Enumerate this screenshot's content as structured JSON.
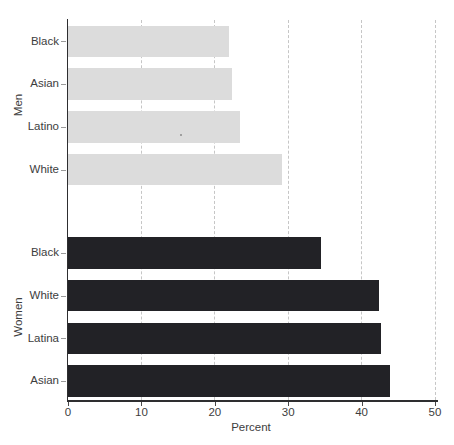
{
  "chart_data": {
    "type": "bar",
    "orientation": "horizontal",
    "title": "",
    "xlabel": "Percent",
    "ylabel": "",
    "xlim": [
      0,
      50
    ],
    "xticks": [
      0,
      10,
      20,
      30,
      40,
      50
    ],
    "grid": "vertical-dashed",
    "legend": "none",
    "groups": [
      {
        "label": "Men",
        "bar_color": "#dcdcdc",
        "categories": [
          "Black",
          "Asian",
          "Latino",
          "White"
        ],
        "values": [
          22.0,
          22.4,
          23.4,
          29.2
        ]
      },
      {
        "label": "Women",
        "bar_color": "#222226",
        "categories": [
          "Black",
          "White",
          "Latina",
          "Asian"
        ],
        "values": [
          34.5,
          42.4,
          42.6,
          43.9
        ]
      }
    ]
  },
  "colors": {
    "background": "#ffffff",
    "men_bar": "#dcdcdc",
    "women_bar": "#222226",
    "gridline": "#c6c6c6",
    "axis": "#2e2e30",
    "text": "#3d3d3d"
  }
}
